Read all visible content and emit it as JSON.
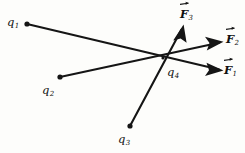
{
  "figure": {
    "background_color": "#fdfdfb",
    "ink_color": "#151515"
  },
  "charges": [
    {
      "id": "q1",
      "base": "q",
      "subscript": "1",
      "point": {
        "x": 27,
        "y": 24
      },
      "label_position": {
        "x": 7,
        "y": 13
      }
    },
    {
      "id": "q2",
      "base": "q",
      "subscript": "2",
      "point": {
        "x": 60,
        "y": 77
      },
      "label_position": {
        "x": 42,
        "y": 81
      }
    },
    {
      "id": "q3",
      "base": "q",
      "subscript": "3",
      "point": {
        "x": 130,
        "y": 126
      },
      "label_position": {
        "x": 118,
        "y": 130
      }
    },
    {
      "id": "q-center",
      "base": "q",
      "subscript": "4",
      "point": {
        "x": 163,
        "y": 58
      },
      "label_position": {
        "x": 167,
        "y": 63
      }
    }
  ],
  "forces": [
    {
      "id": "F1",
      "base": "F",
      "subscript": "1",
      "vector_overline": true,
      "source_charge": "q1",
      "from": {
        "x": 27,
        "y": 24
      },
      "to": {
        "x": 222,
        "y": 70
      },
      "label_position": {
        "x": 224,
        "y": 61
      },
      "arrowhead": true
    },
    {
      "id": "F2",
      "base": "F",
      "subscript": "2",
      "vector_overline": true,
      "source_charge": "q2",
      "from": {
        "x": 60,
        "y": 77
      },
      "to": {
        "x": 222,
        "y": 42
      },
      "label_position": {
        "x": 226,
        "y": 30
      },
      "arrowhead": true
    },
    {
      "id": "F3",
      "base": "F",
      "subscript": "3",
      "vector_overline": true,
      "source_charge": "q3",
      "from": {
        "x": 130,
        "y": 126
      },
      "to": {
        "x": 183,
        "y": 25
      },
      "label_position": {
        "x": 180,
        "y": 5
      },
      "arrowhead": true
    }
  ]
}
